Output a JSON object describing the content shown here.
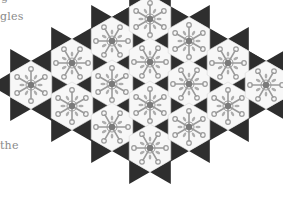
{
  "page": {
    "text_fragments": [
      {
        "id": "top",
        "text": "g"
      },
      {
        "id": "mid",
        "text": "gles"
      },
      {
        "id": "bottom",
        "text": "the"
      }
    ]
  },
  "illustration": {
    "description": "Trihexagonal tiling: white hexagons with grey floral star motifs, surrounded by dark triangles",
    "colors": {
      "triangle": "#2e2e2e",
      "hexagon_fill": "#f7f7f7",
      "motif": "#9a9a9a",
      "motif_dark": "#7a7a7a",
      "text": "#8a8a8a"
    },
    "hex_radius": 24,
    "hexagons": [
      {
        "cx": 31,
        "cy": 85
      },
      {
        "cx": 72,
        "cy": 63
      },
      {
        "cx": 72,
        "cy": 106
      },
      {
        "cx": 112,
        "cy": 41
      },
      {
        "cx": 112,
        "cy": 84
      },
      {
        "cx": 112,
        "cy": 127
      },
      {
        "cx": 150,
        "cy": 19
      },
      {
        "cx": 150,
        "cy": 62
      },
      {
        "cx": 150,
        "cy": 105
      },
      {
        "cx": 150,
        "cy": 148
      },
      {
        "cx": 189,
        "cy": 41
      },
      {
        "cx": 189,
        "cy": 84
      },
      {
        "cx": 189,
        "cy": 127
      },
      {
        "cx": 228,
        "cy": 63
      },
      {
        "cx": 228,
        "cy": 106
      },
      {
        "cx": 266,
        "cy": 85
      }
    ]
  }
}
